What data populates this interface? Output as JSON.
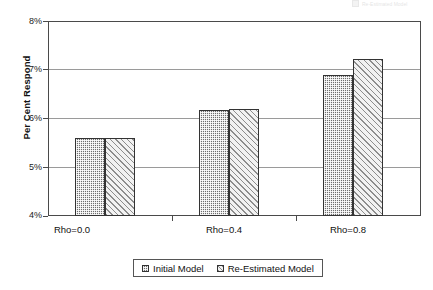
{
  "chart_data": {
    "type": "bar",
    "title": "",
    "xlabel": "",
    "ylabel": "Per Cent Respond",
    "categories": [
      "Rho=0.0",
      "Rho=0.4",
      "Rho=0.8"
    ],
    "series": [
      {
        "name": "Initial Model",
        "values": [
          5.6,
          6.17,
          6.9
        ]
      },
      {
        "name": "Re-Estimated Model",
        "values": [
          5.6,
          6.2,
          7.22
        ]
      }
    ],
    "ylim": [
      4,
      8
    ],
    "yticks": [
      "4%",
      "5%",
      "6%",
      "7%",
      "8%"
    ],
    "ytick_values": [
      4,
      5,
      6,
      7,
      8
    ],
    "grid": "horizontal",
    "legend_position": "bottom",
    "value_suffix": "%"
  },
  "axis": {
    "y_title": "Per Cent Respond",
    "y_tick_labels": [
      "8%",
      "7%",
      "6%",
      "5%",
      "4%"
    ]
  },
  "legend": {
    "items": [
      {
        "label": "Initial Model",
        "pattern": "dark-dotted",
        "color": "#6e6e6e"
      },
      {
        "label": "Re-Estimated Model",
        "pattern": "light-diagonal",
        "color": "#f0f0f0"
      }
    ]
  },
  "x_labels": [
    "Rho=0.0",
    "Rho=0.4",
    "Rho=0.8"
  ],
  "artifact": {
    "clipped_legend_text": "Re-Estimated Model"
  }
}
